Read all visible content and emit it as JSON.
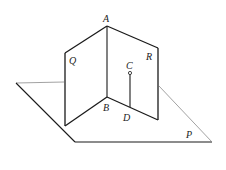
{
  "diagram": {
    "title": "",
    "labels": {
      "A": "A",
      "B": "B",
      "C": "C",
      "D": "D",
      "Q": "Q",
      "R": "R",
      "P": "P"
    },
    "planes": [
      {
        "name": "P",
        "description": "horizontal base plane"
      },
      {
        "name": "Q",
        "description": "vertical half-plane through edge AB, left"
      },
      {
        "name": "R",
        "description": "vertical half-plane through edge AB, right"
      }
    ],
    "segments": [
      {
        "from": "A",
        "to": "B",
        "description": "common edge of Q and R"
      },
      {
        "from": "C",
        "to": "D",
        "description": "segment from point C in plane R perpendicular to line BD"
      }
    ],
    "points": [
      "A",
      "B",
      "C",
      "D"
    ],
    "colors": {
      "line": "#1a1a1a",
      "thin_line": "#8a8a8a"
    }
  }
}
